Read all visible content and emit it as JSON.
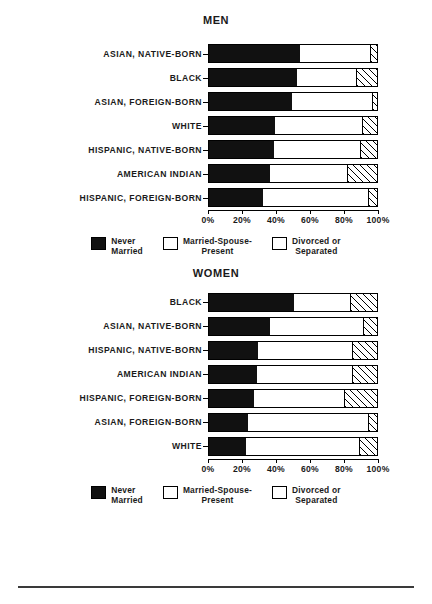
{
  "legend": {
    "items": [
      {
        "key": "never",
        "line1": "Never",
        "line2": "Married"
      },
      {
        "key": "married",
        "line1": "Married-Spouse-",
        "line2": "Present"
      },
      {
        "key": "divorced",
        "line1": "Divorced or",
        "line2": "Separated"
      }
    ]
  },
  "axis": {
    "ticks": [
      "0%",
      "20%",
      "40%",
      "60%",
      "80%",
      "100%"
    ],
    "min": 0,
    "max": 100
  },
  "chart_data": [
    {
      "type": "bar",
      "orientation": "horizontal",
      "stacked": true,
      "title": "MEN",
      "xlabel": "",
      "ylabel": "",
      "xlim": [
        0,
        100
      ],
      "grid": false,
      "legend_position": "bottom",
      "series": [
        {
          "name": "Never Married",
          "values": [
            53.5,
            52.0,
            49.0,
            39.0,
            38.0,
            36.0,
            32.0
          ]
        },
        {
          "name": "Married-Spouse-Present",
          "values": [
            41.2,
            34.5,
            47.0,
            51.0,
            51.0,
            45.0,
            61.5
          ]
        },
        {
          "name": "Divorced or Separated",
          "values": [
            5.3,
            13.5,
            4.0,
            10.0,
            11.0,
            19.0,
            6.5
          ]
        }
      ],
      "categories": [
        "ASIAN, NATIVE-BORN",
        "BLACK",
        "ASIAN, FOREIGN-BORN",
        "WHITE",
        "HISPANIC, NATIVE-BORN",
        "AMERICAN INDIAN",
        "HISPANIC, FOREIGN-BORN"
      ]
    },
    {
      "type": "bar",
      "orientation": "horizontal",
      "stacked": true,
      "title": "WOMEN",
      "xlabel": "",
      "ylabel": "",
      "xlim": [
        0,
        100
      ],
      "grid": false,
      "legend_position": "bottom",
      "series": [
        {
          "name": "Never Married",
          "values": [
            50.0,
            36.0,
            29.0,
            28.0,
            26.5,
            23.0,
            22.0
          ]
        },
        {
          "name": "Married-Spouse-Present",
          "values": [
            33.0,
            54.5,
            55.0,
            56.0,
            53.0,
            70.5,
            66.0
          ]
        },
        {
          "name": "Divorced or Separated",
          "values": [
            17.0,
            9.5,
            16.0,
            16.0,
            20.5,
            6.5,
            12.0
          ]
        }
      ],
      "categories": [
        "BLACK",
        "ASIAN, NATIVE-BORN",
        "HISPANIC, NATIVE-BORN",
        "AMERICAN INDIAN",
        "HISPANIC, FOREIGN-BORN",
        "ASIAN, FOREIGN-BORN",
        "WHITE"
      ]
    }
  ]
}
